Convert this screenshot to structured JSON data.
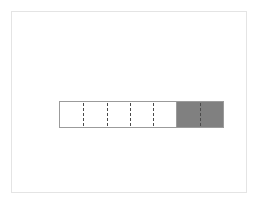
{
  "figure": {
    "title": "",
    "background_color": "#ffffff",
    "frame": {
      "border_color": "#e4e4e4",
      "x": 11,
      "y": 11,
      "width": 236,
      "height": 182
    }
  },
  "chart_data": {
    "type": "bar",
    "orientation": "horizontal",
    "title": "",
    "subtitle": "",
    "xlabel": "",
    "ylabel": "",
    "categories": [
      "progress"
    ],
    "values": [
      2
    ],
    "xlim": [
      0,
      7
    ],
    "ylim": [
      0,
      1
    ],
    "grid": false,
    "legend": null,
    "tick_labels": [],
    "annotations": [],
    "segments": {
      "total": 7,
      "filled": 2,
      "unfilled": 5,
      "filled_fraction": 0.2857,
      "divider_style": "dashed",
      "divider_count": 6
    },
    "colors": {
      "filled": "#808080",
      "unfilled": "#ffffff",
      "bar_outline": "#9b9b9b",
      "divider": "#4a4a4a",
      "frame": "#e4e4e4",
      "background": "#ffffff"
    },
    "geometry": {
      "bar_x": 47,
      "bar_y": 89,
      "bar_width": 165,
      "bar_height": 27,
      "fill_boundary_x": 167,
      "divider_positions_px": [
        71,
        95,
        119,
        143,
        167,
        190
      ]
    }
  }
}
